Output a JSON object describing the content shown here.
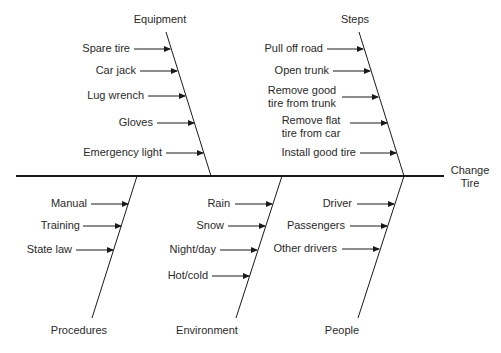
{
  "effect": {
    "label_line1": "Change",
    "label_line2": "Tire"
  },
  "colors": {
    "line": "#1a1a1a",
    "text": "#2a2a2a",
    "background": "#ffffff"
  },
  "categories": {
    "equipment": {
      "label": "Equipment",
      "causes": [
        "Spare tire",
        "Car jack",
        "Lug wrench",
        "Gloves",
        "Emergency light"
      ]
    },
    "steps": {
      "label": "Steps",
      "causes": [
        "Pull off road",
        "Open trunk",
        "Remove good\ntire from trunk",
        "Remove flat\ntire from car",
        "Install good tire"
      ],
      "causes_lines": [
        [
          "Pull off road"
        ],
        [
          "Open trunk"
        ],
        [
          "Remove good",
          "tire from trunk"
        ],
        [
          "Remove flat",
          "tire from car"
        ],
        [
          "Install good tire"
        ]
      ]
    },
    "procedures": {
      "label": "Procedures",
      "causes": [
        "Manual",
        "Training",
        "State law"
      ]
    },
    "environment": {
      "label": "Environment",
      "causes": [
        "Rain",
        "Snow",
        "Night/day",
        "Hot/cold"
      ]
    },
    "people": {
      "label": "People",
      "causes": [
        "Driver",
        "Passengers",
        "Other drivers"
      ]
    }
  }
}
